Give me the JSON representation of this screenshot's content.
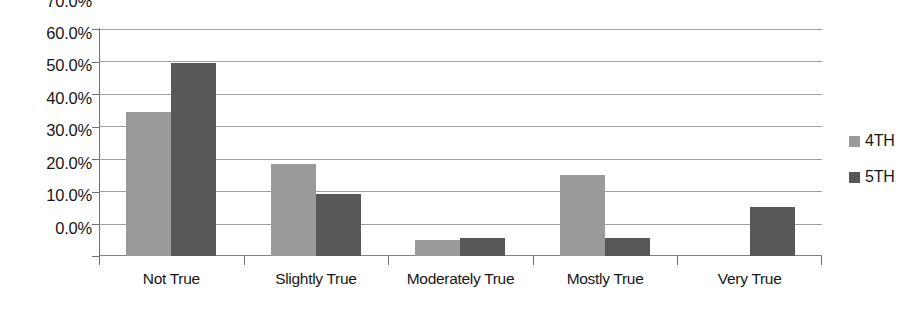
{
  "chart_data": {
    "type": "bar",
    "title": "",
    "subtitle": "",
    "xlabel": "",
    "ylabel": "",
    "categories": [
      "Not True",
      "Slightly True",
      "Moderately True",
      "Mostly True",
      "Very True"
    ],
    "series": [
      {
        "name": "4TH",
        "color": "#9a9a9a",
        "values": [
          44.5,
          28.5,
          5.0,
          25.0,
          0.0
        ]
      },
      {
        "name": "5TH",
        "color": "#585858",
        "values": [
          59.5,
          19.0,
          5.5,
          5.5,
          15.0
        ]
      }
    ],
    "ylim": [
      0,
      70
    ],
    "ytick_values": [
      0,
      10,
      20,
      30,
      40,
      50,
      60,
      70
    ],
    "ytick_labels": [
      "0.0%",
      "10.0%",
      "20.0%",
      "30.0%",
      "40.0%",
      "50.0%",
      "60.0%",
      "70.0%"
    ],
    "grid": true,
    "grid_axis": "y",
    "legend_position": "right",
    "value_format": "percent",
    "plot_background": "#ffffff"
  },
  "legend": {
    "entries": [
      {
        "label": "4TH"
      },
      {
        "label": "5TH"
      }
    ]
  },
  "axes": {
    "y": {
      "labels": [
        "70.0%",
        "60.0%",
        "50.0%",
        "40.0%",
        "30.0%",
        "20.0%",
        "10.0%",
        "0.0%"
      ]
    },
    "x": {
      "labels": [
        "Not True",
        "Slightly True",
        "Moderately True",
        "Mostly True",
        "Very True"
      ]
    }
  }
}
